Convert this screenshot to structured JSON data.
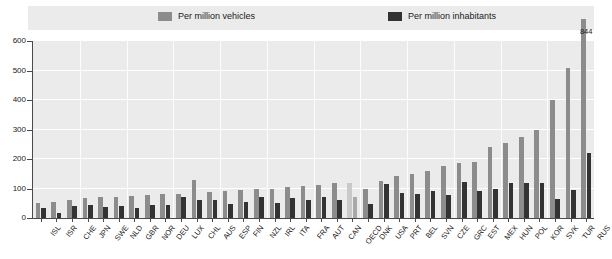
{
  "legend": {
    "items": [
      {
        "label": "Per million vehicles",
        "color": "#8c8c8c",
        "icon": "legend-swatch-icon"
      },
      {
        "label": "Per million inhabitants",
        "color": "#333333",
        "icon": "legend-swatch-icon"
      }
    ]
  },
  "axis": {
    "y_ticks": [
      "0",
      "100",
      "200",
      "300",
      "400",
      "500",
      "600"
    ],
    "y_min": 0,
    "y_max": 600
  },
  "colors": {
    "plot_background": "#ebebeb",
    "legend_background": "#ebebeb",
    "gridline": "#ffffff",
    "axis": "#4a4a4a",
    "series_vehicles": "#8c8c8c",
    "series_inhabitants": "#333333",
    "highlight_vehicles": "#c9c9c9",
    "highlight_inhabitants": "#a8a8a8"
  },
  "annotations": [
    {
      "text": "844",
      "category": "RUS",
      "series": "Per million vehicles"
    }
  ],
  "chart_data": {
    "type": "bar",
    "title": "",
    "xlabel": "",
    "ylabel": "",
    "ylim": [
      0,
      600
    ],
    "grid": true,
    "legend_position": "top",
    "highlight_category": "OECD",
    "categories": [
      "ISL",
      "ISR",
      "CHE",
      "JPN",
      "SWE",
      "NLD",
      "GBR",
      "NOR",
      "DEU",
      "LUX",
      "CHL",
      "AUS",
      "ESP",
      "FIN",
      "NZL",
      "IRL",
      "ITA",
      "FRA",
      "AUT",
      "CAN",
      "OECD",
      "DNK",
      "USA",
      "PRT",
      "BEL",
      "SVN",
      "CZE",
      "GRC",
      "EST",
      "MEX",
      "HUN",
      "POL",
      "KOR",
      "SVK",
      "TUR",
      "RUS"
    ],
    "series": [
      {
        "name": "Per million vehicles",
        "color": "#8c8c8c",
        "values": [
          50,
          55,
          62,
          68,
          70,
          72,
          75,
          78,
          80,
          82,
          130,
          88,
          90,
          95,
          98,
          100,
          105,
          108,
          112,
          118,
          120,
          100,
          125,
          142,
          150,
          160,
          175,
          185,
          190,
          240,
          255,
          275,
          300,
          400,
          510,
          844
        ]
      },
      {
        "name": "Per million inhabitants",
        "color": "#333333",
        "values": [
          35,
          18,
          42,
          45,
          38,
          40,
          35,
          45,
          45,
          70,
          60,
          60,
          48,
          55,
          72,
          50,
          68,
          62,
          70,
          62,
          72,
          48,
          115,
          85,
          80,
          90,
          78,
          122,
          90,
          100,
          120,
          120,
          120,
          65,
          95,
          220
        ]
      }
    ]
  }
}
